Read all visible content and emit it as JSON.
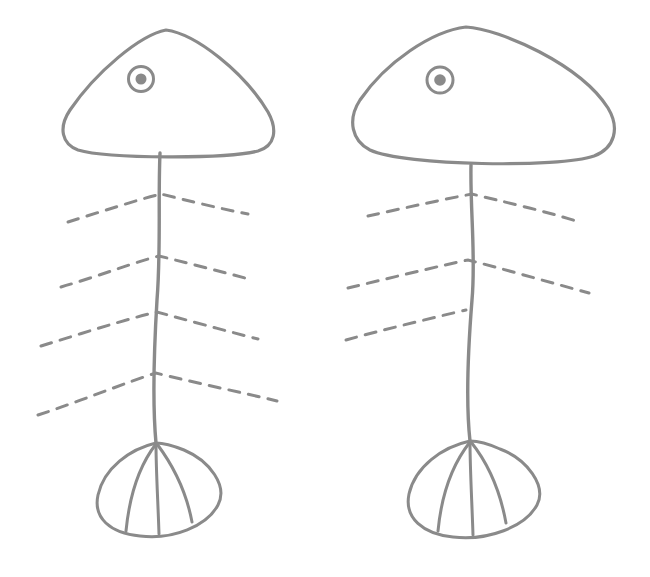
{
  "scene": {
    "title": "Fish skeleton line drawing",
    "description": "Two hand-drawn fish bone figures side by side",
    "background_color": "#ffffff",
    "width": 650,
    "height": 577
  },
  "style": {
    "line_color": "#8a8a8a",
    "eye_ring_color": "#8a8a8a",
    "eye_pupil_color": "#8a8a8a",
    "head_stroke_width": 3.2,
    "spine_stroke_width": 3.4,
    "rib_stroke_width": 3.0,
    "tail_stroke_width": 3.0,
    "eye_ring_stroke_width": 3.0,
    "rib_dash_pattern": "11 9"
  },
  "figures": [
    {
      "id": "fish-left",
      "name": "left-fish",
      "label": "Left fish skeleton",
      "head": {
        "path": "M 166 30 C 140 35 96 72 70 110 C 58 128 62 144 78 150 C 108 159 228 159 258 151 C 275 146 278 130 268 112 C 244 72 196 34 166 30 Z",
        "apex": [
          166,
          30
        ],
        "left_corner": [
          66,
          140
        ],
        "right_corner": [
          270,
          140
        ],
        "bottom_y": 153
      },
      "eye": {
        "cx": 141,
        "cy": 79,
        "ring_r": 12.5,
        "pupil_r": 5.5
      },
      "spine": {
        "path": "M 160 153 C 158 200 161 250 157 300 C 154 350 152 400 156 443",
        "top": [
          160,
          153
        ],
        "bottom": [
          156,
          443
        ]
      },
      "ribs": [
        {
          "path": "M 68 222 C 100 212 140 199 161 194 C 185 200 222 209 248 214",
          "y": 194,
          "left_x": 68,
          "right_x": 248
        },
        {
          "path": "M 61 287 C 96 277 138 261 159 256 C 184 262 222 272 249 279",
          "y": 256,
          "left_x": 61,
          "right_x": 249
        },
        {
          "path": "M 41 346 C 80 334 130 318 157 312 C 183 319 226 331 258 339",
          "y": 312,
          "left_x": 41,
          "right_x": 258
        },
        {
          "path": "M 38 415 C 78 402 130 381 156 373 C 187 381 240 392 277 401",
          "y": 373,
          "left_x": 38,
          "right_x": 277
        }
      ],
      "tail": {
        "outline": "M 156 443 C 130 449 104 468 98 495 C 93 518 110 533 140 536 C 173 540 207 526 218 505 C 228 486 210 461 184 450 C 174 446 164 443 156 443 Z",
        "rays": [
          "M 156 444 C 142 462 130 490 126 531",
          "M 156 444 C 156 470 158 502 159 534",
          "M 157 444 C 172 464 186 490 192 522"
        ],
        "junction": [
          156,
          443
        ]
      }
    },
    {
      "id": "fish-right",
      "name": "right-fish",
      "label": "Right fish skeleton",
      "head": {
        "path": "M 466 27 C 432 31 386 62 360 100 C 347 120 352 141 370 150 C 404 166 560 168 594 156 C 615 148 620 128 608 108 C 580 64 500 29 466 27 Z",
        "apex": [
          466,
          27
        ],
        "left_corner": [
          354,
          136
        ],
        "right_corner": [
          614,
          134
        ],
        "bottom_y": 165
      },
      "eye": {
        "cx": 440,
        "cy": 80,
        "ring_r": 13.0,
        "pupil_r": 5.8
      },
      "spine": {
        "path": "M 471 165 C 470 210 476 255 472 300 C 468 350 466 405 470 441",
        "top": [
          471,
          165
        ],
        "bottom": [
          470,
          441
        ]
      },
      "ribs": [
        {
          "path": "M 368 216 C 404 208 450 198 472 194 C 500 201 545 211 576 221",
          "y": 194,
          "left_x": 368,
          "right_x": 576
        },
        {
          "path": "M 348 288 C 386 279 443 265 468 260 C 500 268 552 283 589 293",
          "y": 260,
          "left_x": 348,
          "right_x": 589
        },
        {
          "path": "M 346 340 C 382 330 440 316 466 310",
          "y": 310,
          "left_x": 346,
          "right_x": 466
        }
      ],
      "tail": {
        "outline": "M 470 441 C 442 447 415 467 409 494 C 404 518 423 534 453 537 C 488 541 525 527 537 505 C 547 486 527 459 500 449 C 489 444 478 441 470 441 Z",
        "rays": [
          "M 470 442 C 455 461 442 489 438 531",
          "M 470 442 C 470 469 472 503 473 535",
          "M 471 442 C 487 462 500 490 506 523"
        ],
        "junction": [
          470,
          441
        ]
      }
    }
  ],
  "chart_data": {
    "type": "scatter",
    "categories": [
      "left-fish",
      "right-fish"
    ],
    "values": [
      4,
      3
    ],
    "xlabel": "figure",
    "ylabel": "rib count",
    "annotations": [
      "Left fish has 4 dashed rib lines",
      "Right fish has 3 dashed rib lines",
      "Each fish: triangular head, ringed eye, curved spine, fan tail with 3 rays"
    ]
  }
}
